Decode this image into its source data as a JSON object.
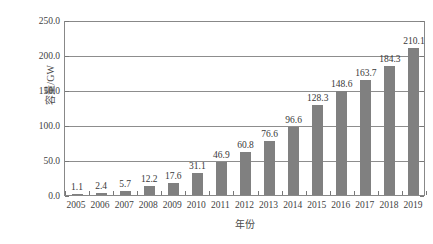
{
  "chart_data": {
    "type": "bar",
    "title": "",
    "xlabel": "年份",
    "ylabel": "容量/GW",
    "categories": [
      "2005",
      "2006",
      "2007",
      "2008",
      "2009",
      "2010",
      "2011",
      "2012",
      "2013",
      "2014",
      "2015",
      "2016",
      "2017",
      "2018",
      "2019"
    ],
    "values": [
      1.1,
      2.4,
      5.7,
      12.2,
      17.6,
      31.1,
      46.9,
      60.8,
      76.6,
      96.6,
      128.3,
      148.6,
      163.7,
      184.3,
      210.1
    ],
    "value_labels": [
      "1.1",
      "2.4",
      "5.7",
      "12.2",
      "17.6",
      "31.1",
      "46.9",
      "60.8",
      "76.6",
      "96.6",
      "128.3",
      "148.6",
      "163.7",
      "184.3",
      "210.1"
    ],
    "ylim": [
      0,
      250
    ],
    "yticks": [
      0,
      50,
      100,
      150,
      200,
      250
    ],
    "ytick_labels": [
      "0.0",
      "50.0",
      "100.0",
      "150.0",
      "200.0",
      "250.0"
    ],
    "grid": "horizontal",
    "legend": "none",
    "bar_color": "#808080",
    "axis_color": "#888888",
    "grid_color": "#8d8d8d",
    "text_color": "#3a3a3a"
  }
}
